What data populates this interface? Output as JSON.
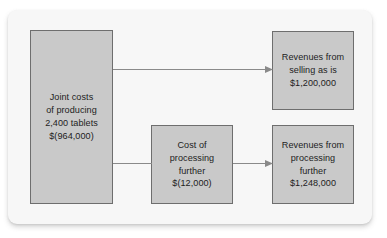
{
  "figure": {
    "card_background": "#f7f7f7",
    "node_fill": "#c9c9c9",
    "node_border": "#6e6e6e",
    "text_color": "#1d1d1d",
    "connector_color": "#8a8a8a"
  },
  "nodes": {
    "joint_costs": {
      "name": "joint-costs",
      "lines": [
        "Joint costs",
        "of producing",
        "2,400 tablets",
        "$(964,000)"
      ],
      "amount": "$(964,000)",
      "quantity": "2,400 tablets"
    },
    "revenues_selling": {
      "name": "revenues-selling-as-is",
      "lines": [
        "Revenues from",
        "selling as is",
        "$1,200,000"
      ],
      "amount": "$1,200,000"
    },
    "cost_processing": {
      "name": "cost-of-processing-further",
      "lines": [
        "Cost of",
        "processing",
        "further",
        "$(12,000)"
      ],
      "amount": "$(12,000)"
    },
    "revenues_processing": {
      "name": "revenues-processing-further",
      "lines": [
        "Revenues from",
        "processing",
        "further",
        "$1,248,000"
      ],
      "amount": "$1,248,000"
    }
  },
  "connectors": [
    {
      "name": "arrow-joint-to-selling",
      "from": "joint_costs",
      "to": "revenues_selling"
    },
    {
      "name": "arrow-joint-to-cost-processing",
      "from": "joint_costs",
      "to": "cost_processing"
    },
    {
      "name": "arrow-cost-processing-to-revenues",
      "from": "cost_processing",
      "to": "revenues_processing"
    }
  ]
}
